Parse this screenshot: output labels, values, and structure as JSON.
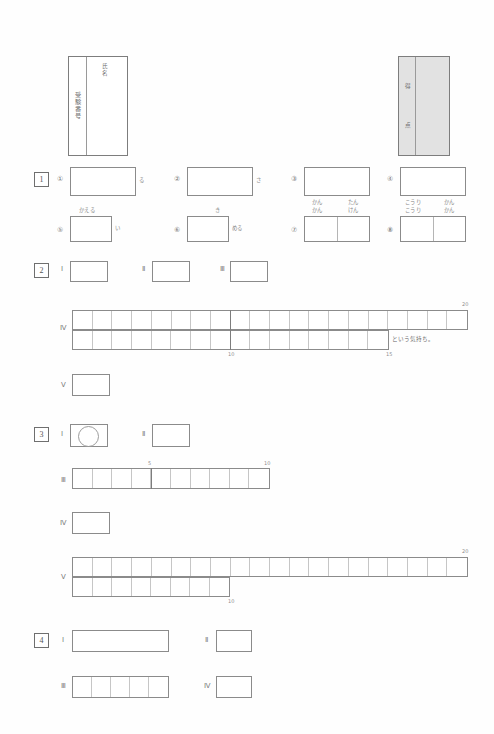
{
  "document": {
    "type": "answer-sheet",
    "language": "ja",
    "paper_color": "#fefefe",
    "ink_color": "#5a5a5a",
    "rule_color": "#8b8b8b",
    "shade_color": "#e2e2e2"
  },
  "header": {
    "exam_number_box": {
      "label": "受験番号",
      "name_label": "氏名"
    },
    "score_box": {
      "label_top": "得",
      "label_bottom": "点"
    }
  },
  "questions": [
    {
      "number": "1",
      "parts_row1": [
        {
          "marker": "①",
          "kana_right": "る"
        },
        {
          "marker": "②",
          "kana_right": "さ"
        },
        {
          "marker": "③",
          "kana_top_left": "かん",
          "kana_top_right": "たん"
        },
        {
          "marker": "④",
          "kana_top_left": "こうり",
          "kana_top_right": "かん"
        }
      ],
      "parts_row2": [
        {
          "marker": "⑤",
          "kana_top": "かえる",
          "kana_right": "い"
        },
        {
          "marker": "⑥",
          "kana_top": "き",
          "kana_right": "める"
        },
        {
          "marker": "⑦",
          "kana_top_left": "かん",
          "kana_top_right": "けん"
        },
        {
          "marker": "⑧",
          "kana_top_left": "こうり",
          "kana_top_right": "かん"
        }
      ]
    },
    {
      "number": "2",
      "parts_row1": [
        {
          "marker": "Ⅰ"
        },
        {
          "marker": "Ⅱ"
        },
        {
          "marker": "Ⅲ"
        }
      ],
      "grid": {
        "marker": "Ⅳ",
        "cells_total": 20,
        "tick_mid": "10",
        "tick_end": "20",
        "tick_step": "15",
        "printed_note": "という気持ち。"
      },
      "small_box": {
        "marker": "Ⅴ"
      }
    },
    {
      "number": "3",
      "parts_row1": [
        {
          "marker": "Ⅰ",
          "answer_mark": "circle"
        },
        {
          "marker": "Ⅱ"
        }
      ],
      "grid_small": {
        "marker": "Ⅲ",
        "cells_total": 10,
        "tick_mid": "5",
        "tick_end": "10"
      },
      "small_box": {
        "marker": "Ⅳ"
      },
      "grid_large": {
        "marker": "Ⅴ",
        "cells_total": 20,
        "tick_mid": "10",
        "tick_end": "20"
      }
    },
    {
      "number": "4",
      "parts_row1": [
        {
          "marker": "Ⅰ"
        },
        {
          "marker": "Ⅱ"
        }
      ],
      "parts_row2": [
        {
          "marker": "Ⅲ",
          "cells": 5
        },
        {
          "marker": "Ⅳ"
        }
      ]
    }
  ]
}
